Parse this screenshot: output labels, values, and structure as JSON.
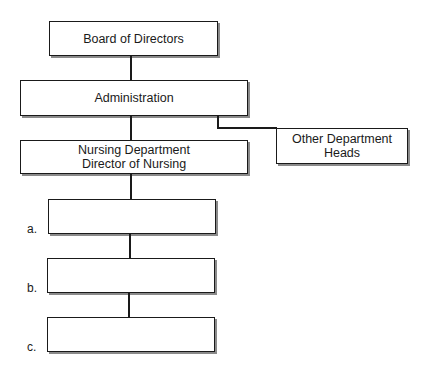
{
  "chart": {
    "board": {
      "label": "Board of Directors"
    },
    "administration": {
      "label": "Administration"
    },
    "nursing": {
      "line1": "Nursing Department",
      "line2": "Director of Nursing"
    },
    "other": {
      "line1": "Other Department",
      "line2": "Heads"
    },
    "blanks": [
      {
        "marker": "a.",
        "label": ""
      },
      {
        "marker": "b.",
        "label": ""
      },
      {
        "marker": "c.",
        "label": ""
      }
    ]
  }
}
